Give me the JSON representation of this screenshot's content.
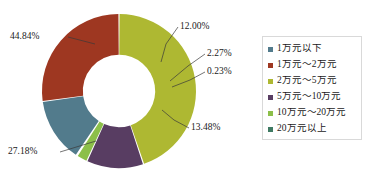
{
  "chart_data": {
    "type": "pie",
    "title": "",
    "subtitle": "",
    "xlabel": "",
    "ylabel": "",
    "donut": true,
    "inner_radius_ratio": 0.47,
    "start_angle_deg": 0,
    "direction": "clockwise",
    "grid": false,
    "legend_position": "right",
    "categories": [
      "1万元以下",
      "1万元～2万元",
      "2万元～5万元",
      "5万元～10万元",
      "10万元～20万元",
      "20万元以上"
    ],
    "values": [
      13.48,
      27.18,
      44.84,
      12.0,
      2.27,
      0.23
    ],
    "value_labels": [
      "13.48%",
      "27.18%",
      "44.84%",
      "12.00%",
      "2.27%",
      "0.23%"
    ],
    "colors": [
      "#527b8c",
      "#9e3721",
      "#aeb832",
      "#583d62",
      "#8cbf49",
      "#3f7a63"
    ],
    "units": "percent",
    "slice_order_clockwise_from_top": [
      "2万元～5万元",
      "5万元～10万元",
      "10万元～20万元",
      "20万元以上",
      "1万元以下",
      "1万元～2万元"
    ]
  },
  "labels": {
    "left_top": "44.84%",
    "left_bottom": "27.18%",
    "right_top": "12.00%",
    "right_mid": "2.27%",
    "right_small": "0.23%",
    "right_bottom": "13.48%"
  },
  "legend": {
    "items": [
      {
        "label": "1万元以下",
        "color": "#527b8c"
      },
      {
        "label": "1万元～2万元",
        "color": "#9e3721"
      },
      {
        "label": "2万元～5万元",
        "color": "#aeb832"
      },
      {
        "label": "5万元～10万元",
        "color": "#583d62"
      },
      {
        "label": "10万元～20万元",
        "color": "#8cbf49"
      },
      {
        "label": "20万元以上",
        "color": "#3f7a63"
      }
    ]
  }
}
